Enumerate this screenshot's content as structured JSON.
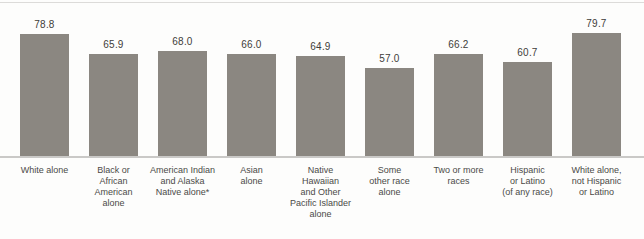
{
  "chart_data": {
    "type": "bar",
    "categories": [
      "White alone",
      "Black or\nAfrican\nAmerican\nalone",
      "American Indian\nand Alaska\nNative alone*",
      "Asian\nalone",
      "Native\nHawaiian\nand Other\nPacific Islander\nalone",
      "Some\nother race\nalone",
      "Two or more\nraces",
      "Hispanic\nor Latino\n(of any race)",
      "White alone,\nnot Hispanic\nor Latino"
    ],
    "values": [
      78.8,
      65.9,
      68.0,
      66.0,
      64.9,
      57.0,
      66.2,
      60.7,
      79.7
    ],
    "title": "",
    "xlabel": "",
    "ylabel": "",
    "ylim": [
      0,
      85
    ],
    "grid": false,
    "legend": false,
    "bar_color": "#8b8781",
    "value_label_color": "#3e3c39",
    "category_label_color": "#4b4a47",
    "axis_line_color": "#cac9c7",
    "top_line_color": "#dcdbd9"
  }
}
